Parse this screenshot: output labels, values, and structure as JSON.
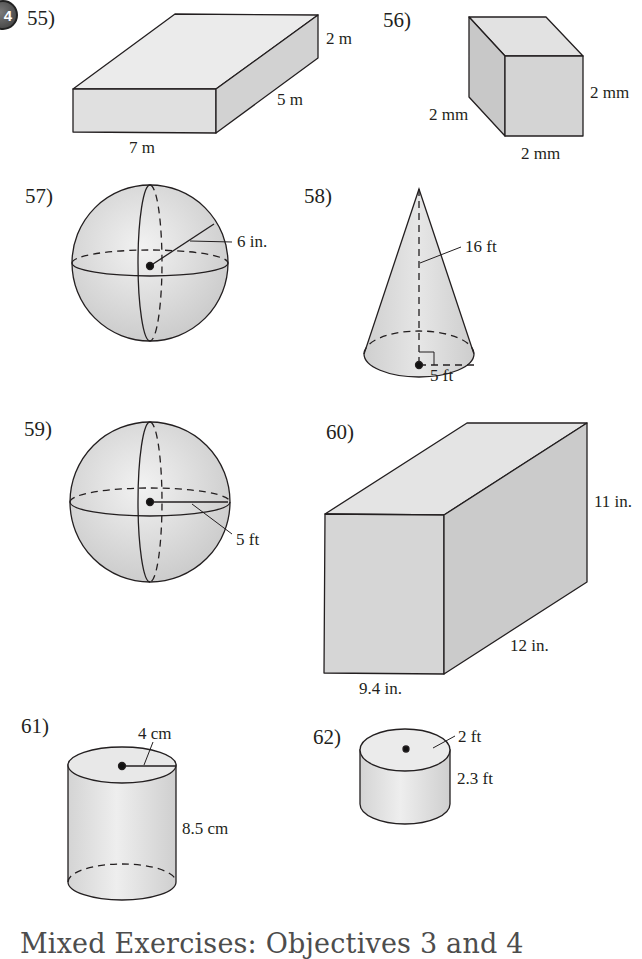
{
  "objective_badge": "4",
  "problems": [
    {
      "number": "55)",
      "shape": "rectangular prism",
      "labels": {
        "length": "7 m",
        "width": "5 m",
        "height": "2 m"
      }
    },
    {
      "number": "56)",
      "shape": "cube",
      "labels": {
        "edge_left": "2 mm",
        "edge_right": "2 mm",
        "edge_bottom": "2 mm"
      }
    },
    {
      "number": "57)",
      "shape": "sphere",
      "labels": {
        "radius": "6 in."
      }
    },
    {
      "number": "58)",
      "shape": "cone",
      "labels": {
        "height": "16 ft",
        "radius": "5 ft"
      }
    },
    {
      "number": "59)",
      "shape": "sphere",
      "labels": {
        "radius": "5 ft"
      }
    },
    {
      "number": "60)",
      "shape": "rectangular prism",
      "labels": {
        "height": "11 in.",
        "depth": "12 in.",
        "width": "9.4 in."
      }
    },
    {
      "number": "61)",
      "shape": "cylinder",
      "labels": {
        "radius": "4 cm",
        "height": "8.5 cm"
      }
    },
    {
      "number": "62)",
      "shape": "cylinder",
      "labels": {
        "radius": "2 ft",
        "height": "2.3 ft"
      }
    }
  ],
  "section_heading": "Mixed Exercises: Objectives 3 and 4",
  "colors": {
    "fill_light": "#e6e6e6",
    "fill_mid": "#d6d6d6",
    "fill_dark": "#c4c4c4",
    "stroke": "#231f20",
    "heading": "#4d4d4d"
  }
}
